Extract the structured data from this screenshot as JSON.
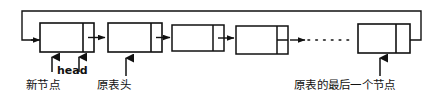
{
  "figure": {
    "stroke_color": "#111111",
    "background_color": "#ffffff"
  },
  "labels": {
    "new_node": "新节点",
    "head": "head",
    "old_list_head": "原表头",
    "last_node_of_old_list": "原表的最后一个节点"
  },
  "diagram_data": {
    "type": "linked-list",
    "circular": true,
    "node_count_drawn": 5,
    "ellipsis_between": [
      4,
      5
    ],
    "nodes": [
      {
        "index": 1,
        "x": 40,
        "y": 23,
        "width": 54,
        "height": 29,
        "data_field_width": 43,
        "pointer_field_width": 11,
        "pointer_split": false,
        "label": "新节点"
      },
      {
        "index": 2,
        "x": 108,
        "y": 23,
        "width": 54,
        "height": 29,
        "data_field_width": 43,
        "pointer_field_width": 11,
        "pointer_split": false,
        "label": "原表头"
      },
      {
        "index": 3,
        "x": 172,
        "y": 25,
        "width": 52,
        "height": 26,
        "data_field_width": 41,
        "pointer_field_width": 11,
        "pointer_split": false,
        "label": ""
      },
      {
        "index": 4,
        "x": 236,
        "y": 26,
        "width": 52,
        "height": 28,
        "data_field_width": 41,
        "pointer_field_width": 11,
        "pointer_split": true,
        "label": ""
      },
      {
        "index": 5,
        "x": 358,
        "y": 24,
        "width": 52,
        "height": 29,
        "data_field_width": 38,
        "pointer_field_width": 14,
        "pointer_split": false,
        "label": "原表的最后一个节点"
      }
    ],
    "arrows": [
      {
        "from": "loop-back",
        "to": "node1",
        "style": "solid"
      },
      {
        "from": "node1",
        "to": "node2",
        "style": "solid"
      },
      {
        "from": "node2",
        "to": "node3",
        "style": "solid"
      },
      {
        "from": "node3",
        "to": "node4",
        "style": "solid"
      },
      {
        "from": "node4",
        "to": "ellipsis",
        "style": "solid"
      },
      {
        "from": "ellipsis",
        "to": "node5",
        "style": "dotted"
      },
      {
        "from": "node5",
        "to": "loop-top",
        "style": "solid"
      }
    ],
    "pointer_arrows_up": [
      {
        "target": "node1",
        "x": 52,
        "label": "新节点"
      },
      {
        "target": "node1",
        "x": 79,
        "label": "head"
      },
      {
        "target": "node2",
        "x": 126,
        "label": "原表头"
      },
      {
        "target": "node5",
        "x": 380,
        "label": "原表的最后一个节点"
      }
    ]
  }
}
